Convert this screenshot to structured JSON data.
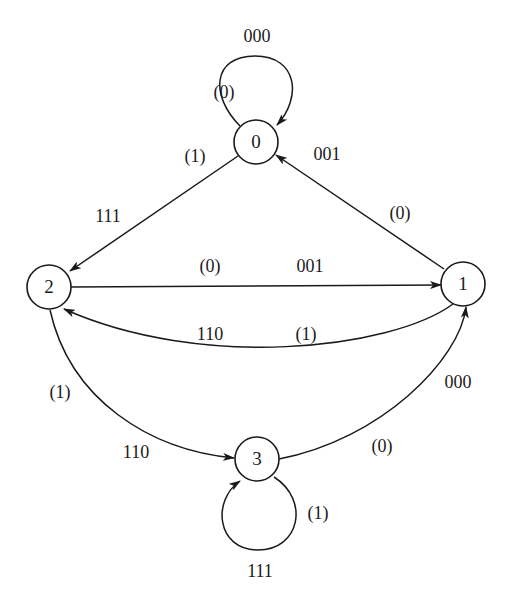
{
  "diagram": {
    "type": "state-transition-diagram",
    "colors": {
      "stroke": "#1a1a1a",
      "background": "#ffffff"
    },
    "nodes": [
      {
        "id": "0",
        "label": "0"
      },
      {
        "id": "1",
        "label": "1"
      },
      {
        "id": "2",
        "label": "2"
      },
      {
        "id": "3",
        "label": "3"
      }
    ],
    "edges": [
      {
        "from": "0",
        "to": "0",
        "input": "(0)",
        "output": "000"
      },
      {
        "from": "0",
        "to": "2",
        "input": "(1)",
        "output": "111"
      },
      {
        "from": "1",
        "to": "0",
        "input": "(0)",
        "output": "001"
      },
      {
        "from": "2",
        "to": "1",
        "input": "(0)",
        "output": "001"
      },
      {
        "from": "1",
        "to": "2",
        "input": "(1)",
        "output": "110"
      },
      {
        "from": "2",
        "to": "3",
        "input": "(1)",
        "output": "110"
      },
      {
        "from": "3",
        "to": "1",
        "input": "(0)",
        "output": "000"
      },
      {
        "from": "3",
        "to": "3",
        "input": "(1)",
        "output": "111"
      }
    ]
  }
}
